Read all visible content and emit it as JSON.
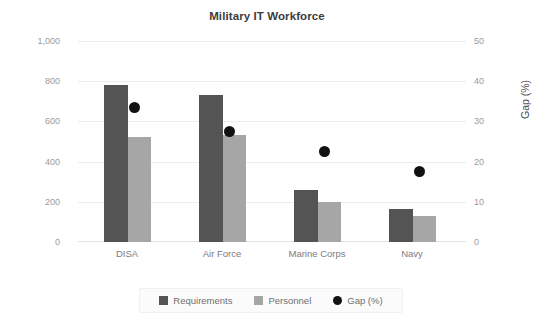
{
  "chart_data": {
    "type": "bar",
    "title": "Military IT Workforce",
    "categories": [
      "DISA",
      "Air Force",
      "Marine Corps",
      "Navy"
    ],
    "series": [
      {
        "name": "Requirements",
        "axis": "left",
        "color": "#545454",
        "values": [
          780,
          730,
          260,
          165
        ]
      },
      {
        "name": "Personnel",
        "axis": "left",
        "color": "#a6a6a6",
        "values": [
          520,
          530,
          200,
          130
        ]
      },
      {
        "name": "Gap (%)",
        "axis": "right",
        "type": "scatter",
        "color": "#121212",
        "values": [
          33.5,
          27.5,
          22.5,
          17.5
        ]
      }
    ],
    "xlabel": "",
    "ylabel": "Requirements or personnel",
    "y2label": "Gap (%)",
    "ylim": [
      0,
      1000
    ],
    "y2lim": [
      0,
      50
    ],
    "yticks": [
      "0",
      "200",
      "400",
      "600",
      "800",
      "1,000"
    ],
    "y2ticks": [
      "0",
      "10",
      "20",
      "30",
      "40",
      "50"
    ],
    "grid": true,
    "legend_position": "bottom"
  },
  "axes": {
    "left_title": "Requirements or personnel",
    "right_title": "Gap (%)",
    "left_ticks": [
      {
        "label": "1,000",
        "value": 1000
      },
      {
        "label": "800",
        "value": 800
      },
      {
        "label": "600",
        "value": 600
      },
      {
        "label": "400",
        "value": 400
      },
      {
        "label": "200",
        "value": 200
      },
      {
        "label": "0",
        "value": 0
      }
    ],
    "right_ticks": [
      {
        "label": "50",
        "value": 50
      },
      {
        "label": "40",
        "value": 40
      },
      {
        "label": "30",
        "value": 30
      },
      {
        "label": "20",
        "value": 20
      },
      {
        "label": "10",
        "value": 10
      },
      {
        "label": "0",
        "value": 0
      }
    ],
    "categories": [
      "DISA",
      "Air Force",
      "Marine Corps",
      "Navy"
    ]
  },
  "legend": {
    "items": [
      {
        "label": "Requirements",
        "color": "#545454",
        "shape": "square"
      },
      {
        "label": "Personnel",
        "color": "#a6a6a6",
        "shape": "square"
      },
      {
        "label": "Gap (%)",
        "color": "#121212",
        "shape": "circle"
      }
    ]
  },
  "colors": {
    "requirements": "#545454",
    "personnel": "#a6a6a6",
    "gap": "#121212",
    "grid": "#ececed",
    "text": "#4d4d4f",
    "tick_text": "#9a9a9c",
    "background": "#ffffff"
  }
}
